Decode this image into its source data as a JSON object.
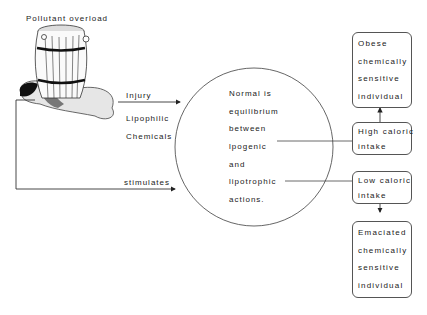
{
  "title": "Pollutant overload",
  "left_labels": {
    "injury": "Injury",
    "lipophilic": "Lipophilic",
    "chemicals": "Chemicals",
    "stimulates": "stimulates"
  },
  "circle": {
    "lines": [
      "Normal is",
      "equilibrium",
      "between",
      "lpogenic",
      "and",
      "lipotrophic",
      "actions."
    ]
  },
  "boxes": {
    "obese": [
      "Obese",
      "chemically",
      "sensitive",
      "individual"
    ],
    "high": [
      "High caloric",
      "intake"
    ],
    "low": [
      "Low caloric",
      "intake"
    ],
    "emaciated": [
      "Emaciated",
      "chemically",
      "sensitive",
      "individual"
    ]
  },
  "colors": {
    "line": "#333333",
    "text": "#1a1a1a"
  }
}
